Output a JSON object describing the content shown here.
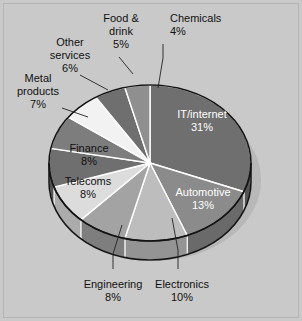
{
  "chart_data": {
    "type": "pie",
    "title": "",
    "subtitle": "",
    "xlabel": "",
    "ylabel": "",
    "legend_position": "none",
    "grid": false,
    "units": "percent",
    "start_angle_deg": 0,
    "direction": "clockwise",
    "categories": [
      "IT/internet",
      "Automotive",
      "Electronics",
      "Engineering",
      "Telecoms",
      "Finance",
      "Metal products",
      "Other services",
      "Food & drink",
      "Chemicals"
    ],
    "values": [
      31,
      13,
      10,
      8,
      8,
      8,
      7,
      6,
      5,
      4
    ],
    "slices": [
      {
        "label": "IT/internet",
        "value": 31,
        "value_text": "31%",
        "color": "#6f6f6f",
        "side_color": "#545454",
        "label_placement": "inside",
        "label_color": "#ffffff"
      },
      {
        "label": "Automotive",
        "value": 13,
        "value_text": "13%",
        "color": "#8b8b8b",
        "side_color": "#6a6a6a",
        "label_placement": "inside",
        "label_color": "#ffffff"
      },
      {
        "label": "Electronics",
        "value": 10,
        "value_text": "10%",
        "color": "#bdbdbd",
        "side_color": "#949494",
        "label_placement": "outside",
        "label_color": "#111111"
      },
      {
        "label": "Engineering",
        "value": 8,
        "value_text": "8%",
        "color": "#a3a3a3",
        "side_color": "#7e7e7e",
        "label_placement": "outside",
        "label_color": "#111111"
      },
      {
        "label": "Telecoms",
        "value": 8,
        "value_text": "8%",
        "color": "#dcdcdc",
        "side_color": "#ababab",
        "label_placement": "inside",
        "label_color": "#111111"
      },
      {
        "label": "Finance",
        "value": 8,
        "value_text": "8%",
        "color": "#6f6f6f",
        "side_color": "#545454",
        "label_placement": "inside",
        "label_color": "#ffffff"
      },
      {
        "label": "Metal products",
        "value": 7,
        "value_text": "7%",
        "color": "#7d7d7d",
        "side_color": "#5f5f5f",
        "label_placement": "outside",
        "label_color": "#111111"
      },
      {
        "label": "Other services",
        "value": 6,
        "value_text": "6%",
        "color": "#f2f2f2",
        "side_color": "#bcbcbc",
        "label_placement": "outside",
        "label_color": "#111111"
      },
      {
        "label": "Food & drink",
        "value": 5,
        "value_text": "5%",
        "color": "#6f6f6f",
        "side_color": "#545454",
        "label_placement": "outside",
        "label_color": "#111111"
      },
      {
        "label": "Chemicals",
        "value": 4,
        "value_text": "4%",
        "color": "#8f8f8f",
        "side_color": "#6d6d6d",
        "label_placement": "outside",
        "label_color": "#111111"
      }
    ],
    "colors": {
      "background": "#c9c9c9",
      "frame_border": "#b4b4b4",
      "pie_outline": "#111111",
      "slice_divider": "#ffffff",
      "shadow": "#9a9a9a",
      "text": "#111111",
      "text_on_dark": "#ffffff"
    },
    "annotations": [
      {
        "text": "Food & drink 5%",
        "leader": true
      },
      {
        "text": "Chemicals 4%",
        "leader": true
      },
      {
        "text": "Other services 6%",
        "leader": true
      },
      {
        "text": "Metal products 7%",
        "leader": true
      },
      {
        "text": "Engineering 8%",
        "leader": true
      },
      {
        "text": "Electronics 10%",
        "leader": true
      }
    ]
  },
  "labels": {
    "it_internet": {
      "name": "IT/internet",
      "pct": "31%"
    },
    "automotive": {
      "name": "Automotive",
      "pct": "13%"
    },
    "electronics": {
      "name": "Electronics",
      "pct": "10%"
    },
    "engineering": {
      "name": "Engineering",
      "pct": "8%"
    },
    "telecoms": {
      "name": "Telecoms",
      "pct": "8%"
    },
    "finance": {
      "name": "Finance",
      "pct": "8%"
    },
    "metal_line1": {
      "name": "Metal",
      "line2": "products",
      "pct": "7%"
    },
    "other_line1": {
      "name": "Other",
      "line2": "services",
      "pct": "6%"
    },
    "food_line1": {
      "name": "Food &",
      "line2": "drink",
      "pct": "5%"
    },
    "chemicals": {
      "name": "Chemicals",
      "pct": "4%"
    }
  }
}
